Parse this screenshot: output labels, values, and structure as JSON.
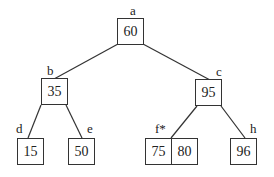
{
  "diagram": {
    "type": "tree",
    "nodes": [
      {
        "id": "a",
        "label": "a",
        "keys": [
          "60"
        ],
        "box": [
          117,
          18,
          27,
          27
        ],
        "label_pos": [
          130,
          4
        ]
      },
      {
        "id": "b",
        "label": "b",
        "keys": [
          "35"
        ],
        "box": [
          41,
          78,
          27,
          27
        ],
        "label_pos": [
          47,
          64
        ]
      },
      {
        "id": "c",
        "label": "c",
        "keys": [
          "95"
        ],
        "box": [
          195,
          79,
          27,
          27
        ],
        "label_pos": [
          216,
          65
        ]
      },
      {
        "id": "d",
        "label": "d",
        "keys": [
          "15"
        ],
        "box": [
          17,
          138,
          27,
          27
        ],
        "label_pos": [
          16,
          122
        ]
      },
      {
        "id": "e",
        "label": "e",
        "keys": [
          "50"
        ],
        "box": [
          68,
          138,
          27,
          27
        ],
        "label_pos": [
          87,
          122
        ]
      },
      {
        "id": "f",
        "label": "f*",
        "keys": [
          "75",
          "80"
        ],
        "box": [
          145,
          138,
          53,
          27
        ],
        "label_pos": [
          155,
          122
        ]
      },
      {
        "id": "h",
        "label": "h",
        "keys": [
          "96"
        ],
        "box": [
          230,
          138,
          27,
          27
        ],
        "label_pos": [
          250,
          122
        ]
      }
    ],
    "edges": [
      {
        "from": "a",
        "to": "b",
        "line": [
          118,
          44,
          54,
          79
        ]
      },
      {
        "from": "a",
        "to": "c",
        "line": [
          143,
          44,
          210,
          80
        ]
      },
      {
        "from": "b",
        "to": "d",
        "line": [
          41,
          105,
          28,
          138
        ]
      },
      {
        "from": "b",
        "to": "e",
        "line": [
          66,
          105,
          82,
          138
        ]
      },
      {
        "from": "c",
        "to": "f",
        "line": [
          197,
          106,
          171,
          138
        ]
      },
      {
        "from": "c",
        "to": "h",
        "line": [
          221,
          106,
          245,
          138
        ]
      }
    ]
  }
}
